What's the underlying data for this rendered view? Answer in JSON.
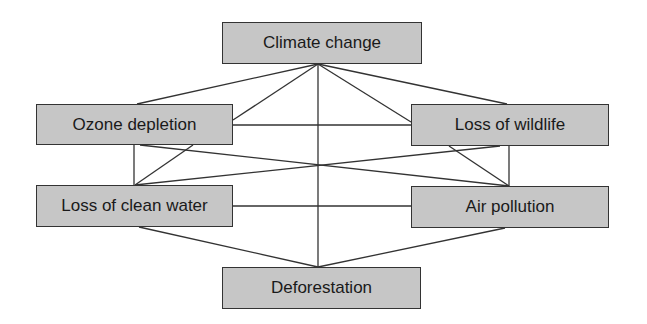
{
  "diagram": {
    "type": "network",
    "colors": {
      "node_fill": "#c6c6c6",
      "node_border": "#333333",
      "edge": "#333333",
      "text": "#1a1a1a",
      "background": "#ffffff"
    },
    "nodes": [
      {
        "id": "climate",
        "label": "Climate change",
        "x": 222,
        "y": 22,
        "w": 200,
        "h": 42
      },
      {
        "id": "ozone",
        "label": "Ozone depletion",
        "x": 36,
        "y": 104,
        "w": 197,
        "h": 41
      },
      {
        "id": "wildlife",
        "label": "Loss of wildlife",
        "x": 411,
        "y": 104,
        "w": 198,
        "h": 42
      },
      {
        "id": "water",
        "label": "Loss of clean water",
        "x": 36,
        "y": 185,
        "w": 197,
        "h": 42
      },
      {
        "id": "air",
        "label": "Air pollution",
        "x": 411,
        "y": 186,
        "w": 198,
        "h": 42
      },
      {
        "id": "deforest",
        "label": "Deforestation",
        "x": 222,
        "y": 267,
        "w": 199,
        "h": 42
      }
    ],
    "edges": [
      {
        "from": "climate",
        "to": "ozone",
        "x1": 318,
        "y1": 64,
        "x2": 137,
        "y2": 104
      },
      {
        "from": "climate",
        "to": "ozone",
        "x1": 318,
        "y1": 64,
        "x2": 233,
        "y2": 120
      },
      {
        "from": "climate",
        "to": "deforest",
        "x1": 318,
        "y1": 64,
        "x2": 318,
        "y2": 267
      },
      {
        "from": "climate",
        "to": "wildlife",
        "x1": 318,
        "y1": 64,
        "x2": 411,
        "y2": 122
      },
      {
        "from": "climate",
        "to": "wildlife",
        "x1": 318,
        "y1": 64,
        "x2": 507,
        "y2": 104
      },
      {
        "from": "ozone",
        "to": "wildlife",
        "x1": 233,
        "y1": 125,
        "x2": 411,
        "y2": 125
      },
      {
        "from": "ozone",
        "to": "water",
        "x1": 134,
        "y1": 145,
        "x2": 134,
        "y2": 185
      },
      {
        "from": "ozone",
        "to": "water",
        "x1": 193,
        "y1": 145,
        "x2": 135,
        "y2": 185
      },
      {
        "from": "ozone",
        "to": "air",
        "x1": 140,
        "y1": 145,
        "x2": 509,
        "y2": 186
      },
      {
        "from": "water",
        "to": "wildlife",
        "x1": 135,
        "y1": 185,
        "x2": 500,
        "y2": 146
      },
      {
        "from": "wildlife",
        "to": "air",
        "x1": 449,
        "y1": 146,
        "x2": 509,
        "y2": 186
      },
      {
        "from": "wildlife",
        "to": "air",
        "x1": 509,
        "y1": 146,
        "x2": 509,
        "y2": 186
      },
      {
        "from": "water",
        "to": "air",
        "x1": 233,
        "y1": 206,
        "x2": 411,
        "y2": 206
      },
      {
        "from": "water",
        "to": "deforest",
        "x1": 139,
        "y1": 227,
        "x2": 318,
        "y2": 267
      },
      {
        "from": "air",
        "to": "deforest",
        "x1": 505,
        "y1": 228,
        "x2": 318,
        "y2": 267
      }
    ]
  }
}
